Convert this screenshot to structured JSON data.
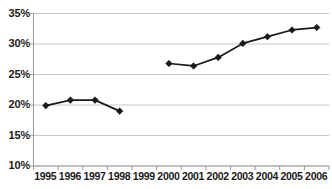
{
  "chart_data": {
    "type": "line",
    "title": "",
    "subtitle": "",
    "xlabel": "",
    "ylabel": "",
    "categories": [
      "1995",
      "1996",
      "1997",
      "1998",
      "1999",
      "2000",
      "2001",
      "2002",
      "2003",
      "2004",
      "2005",
      "2006"
    ],
    "series": [
      {
        "name": "",
        "values": [
          19.9,
          20.8,
          20.8,
          19.0,
          null,
          26.8,
          26.4,
          27.8,
          30.1,
          31.2,
          32.3,
          32.7
        ]
      }
    ],
    "ylim": [
      10,
      35
    ],
    "ytick_values": [
      10,
      15,
      20,
      25,
      30,
      35
    ],
    "ytick_labels": [
      "10%",
      "15%",
      "20%",
      "25%",
      "30%",
      "35%"
    ],
    "grid": true,
    "grid_axis": "y",
    "legend": false,
    "legend_position": "none",
    "annotations": [],
    "series_color": "#1a1a1a",
    "grid_color": "#c8c8c8",
    "axis_color": "#9a9a9a",
    "marker": "diamond",
    "gap_years": [
      "1999"
    ]
  }
}
